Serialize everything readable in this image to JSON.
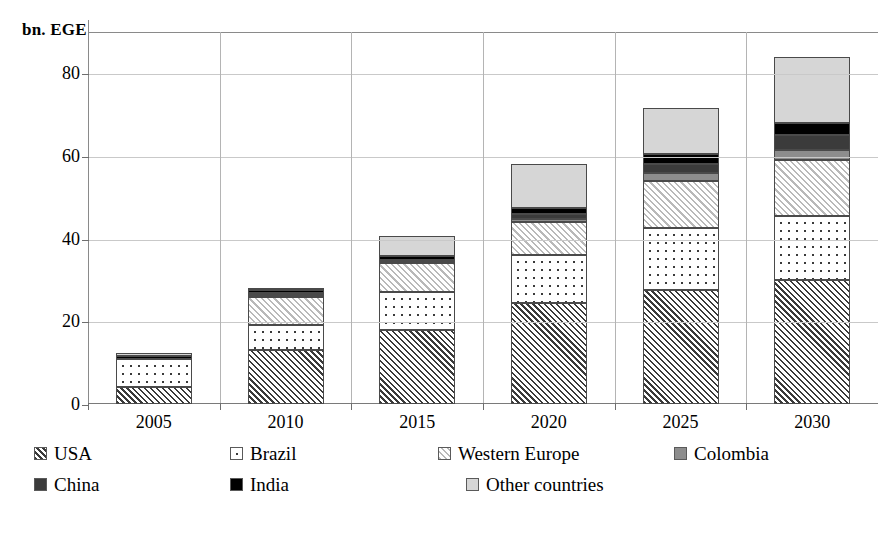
{
  "chart_data": {
    "type": "bar",
    "stacked": true,
    "title": "",
    "subtitle": "",
    "xlabel": "",
    "ylabel": "bn. EGE",
    "ylim": [
      0,
      90
    ],
    "yticks": [
      0,
      20,
      40,
      60,
      80
    ],
    "grid": true,
    "legend_position": "bottom",
    "categories": [
      "2005",
      "2010",
      "2015",
      "2020",
      "2025",
      "2030"
    ],
    "series": [
      {
        "name": "USA",
        "pattern": "diagonal-hatch-dark",
        "values": [
          4.2,
          13.0,
          18.0,
          24.5,
          27.5,
          30.0
        ]
      },
      {
        "name": "Brazil",
        "pattern": "dotted",
        "values": [
          6.8,
          6.0,
          9.0,
          11.5,
          15.0,
          15.5
        ]
      },
      {
        "name": "Western Europe",
        "pattern": "diagonal-hatch-light",
        "values": [
          0.0,
          7.0,
          7.0,
          8.0,
          11.5,
          13.5
        ]
      },
      {
        "name": "Colombia",
        "color": "#8d8d8d",
        "values": [
          0.0,
          0.4,
          0.4,
          0.8,
          2.0,
          2.5
        ]
      },
      {
        "name": "China",
        "color": "#3b3b3b",
        "values": [
          0.0,
          0.5,
          0.5,
          1.2,
          2.0,
          3.5
        ]
      },
      {
        "name": "India",
        "color": "#000000",
        "values": [
          0.5,
          0.6,
          0.8,
          1.5,
          2.5,
          3.0
        ]
      },
      {
        "name": "Other countries",
        "color": "#d6d6d6",
        "values": [
          0.8,
          0.5,
          5.0,
          10.5,
          11.0,
          16.0
        ]
      }
    ],
    "totals": [
      12.3,
      28.0,
      40.7,
      58.0,
      71.5,
      84.0
    ]
  },
  "legend": {
    "rows": [
      [
        {
          "label": "USA",
          "swatch": "diagonal-hatch-dark"
        },
        {
          "label": "Brazil",
          "swatch": "dotted"
        },
        {
          "label": "Western Europe",
          "swatch": "diagonal-hatch-light"
        },
        {
          "label": "Colombia",
          "swatch": "solid-gray"
        }
      ],
      [
        {
          "label": "China",
          "swatch": "solid-dark-gray"
        },
        {
          "label": "India",
          "swatch": "solid-black"
        },
        {
          "label": "Other countries",
          "swatch": "solid-light-gray"
        }
      ]
    ]
  },
  "axis": {
    "y_title": "bn. EGE",
    "y_ticks": [
      "0",
      "20",
      "40",
      "60",
      "80"
    ],
    "x_ticks": [
      "2005",
      "2010",
      "2015",
      "2020",
      "2025",
      "2030"
    ]
  },
  "colors": {
    "colombia": "#8d8d8d",
    "china": "#3b3b3b",
    "india": "#000000",
    "other": "#d6d6d6",
    "grid": "#c9c9c9",
    "axis": "#7a7a7a"
  }
}
